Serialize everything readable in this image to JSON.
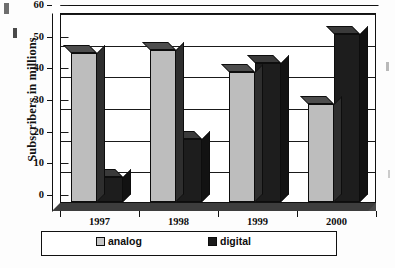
{
  "chart_data": {
    "type": "bar",
    "title": "",
    "subtitle": "",
    "xlabel": "",
    "ylabel": "Subscribers in millions",
    "categories": [
      "1997",
      "1998",
      "1999",
      "2000"
    ],
    "series": [
      {
        "name": "analog",
        "color": "#bdbdbd",
        "values": [
          47,
          48,
          41,
          31
        ]
      },
      {
        "name": "digital",
        "color": "#1d1d1d",
        "values": [
          8,
          20,
          44,
          53
        ]
      }
    ],
    "ylim": [
      0,
      60
    ],
    "ytick_values": [
      0,
      10,
      20,
      30,
      40,
      50,
      60
    ],
    "ytick_labels": [
      "0",
      "10",
      "20",
      "30",
      "40",
      "50",
      "60"
    ],
    "grid": true,
    "grid_axis": "y",
    "legend_position": "bottom",
    "three_d": true,
    "annotations": []
  },
  "axes": {
    "y_title": "Subscribers in millions",
    "y_ticks": [
      "60",
      "50",
      "40",
      "30",
      "20",
      "10",
      "0"
    ],
    "x_ticks": [
      "1997",
      "1998",
      "1999",
      "2000"
    ]
  },
  "legend": {
    "entries": [
      {
        "label": "analog",
        "swatch": "analog-swatch"
      },
      {
        "label": "digital",
        "swatch": "digital-swatch"
      }
    ]
  }
}
